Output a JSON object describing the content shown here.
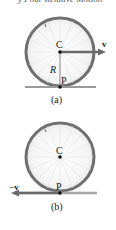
{
  "header": {
    "text": "y Pour Relative Motion"
  },
  "colors": {
    "rim": "#6f6f6f",
    "spokes": "#d9d9d9",
    "ground": "#9a9a9a",
    "arrow": "#6a6a6a",
    "point": "#111111"
  },
  "panels": [
    {
      "id": "a",
      "caption": "(a)",
      "center_label": "C",
      "contact_label": "P",
      "radius_label": "R",
      "vector_label": "v⃗",
      "vector_direction": "right",
      "vector_origin": "C"
    },
    {
      "id": "b",
      "caption": "(b)",
      "center_label": "C",
      "contact_label": "P",
      "vector_label": "−v⃗",
      "vector_direction": "left",
      "vector_origin": "P"
    }
  ]
}
